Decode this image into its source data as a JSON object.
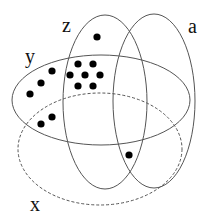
{
  "diagram": {
    "sets": [
      {
        "id": "z",
        "label": "z",
        "cx": 105,
        "cy": 102,
        "rx": 42,
        "ry": 87,
        "style": "solid",
        "label_pos": [
          62,
          32
        ]
      },
      {
        "id": "a",
        "label": "a",
        "cx": 154,
        "cy": 101,
        "rx": 41,
        "ry": 87,
        "style": "solid",
        "label_pos": [
          188,
          33
        ]
      },
      {
        "id": "y",
        "label": "y",
        "cx": 101,
        "cy": 100,
        "rx": 89,
        "ry": 45,
        "style": "solid",
        "label_pos": [
          25,
          63
        ]
      },
      {
        "id": "x",
        "label": "x",
        "cx": 100,
        "cy": 149,
        "rx": 82,
        "ry": 56,
        "style": "dashed",
        "label_pos": [
          30,
          211
        ]
      }
    ],
    "points": [
      [
        97,
        37
      ],
      [
        78,
        64
      ],
      [
        93,
        64
      ],
      [
        70,
        75
      ],
      [
        85,
        75
      ],
      [
        100,
        75
      ],
      [
        78,
        86
      ],
      [
        93,
        86
      ],
      [
        52,
        71
      ],
      [
        41,
        83
      ],
      [
        30,
        94
      ],
      [
        52,
        117
      ],
      [
        41,
        124
      ],
      [
        129,
        155
      ]
    ],
    "stroke_color": "#555555",
    "point_color": "#000000"
  }
}
